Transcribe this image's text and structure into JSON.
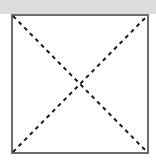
{
  "figure": {
    "caption": "",
    "canvas": {
      "width": 156,
      "height": 162,
      "background_color": "#ffffff"
    },
    "top_band": {
      "name": "grey header band",
      "color": "#dcdcdc",
      "x": 0,
      "y": 0,
      "width": 156,
      "height": 14
    },
    "square": {
      "label": "square outline",
      "x": 12,
      "y": 15,
      "width": 136,
      "height": 138,
      "stroke_color": "#6b6b6b",
      "stroke_width": 2,
      "fill_color": "#ffffff",
      "corners": {
        "top_left": [
          12,
          15
        ],
        "top_right": [
          148,
          15
        ],
        "bottom_right": [
          148,
          153
        ],
        "bottom_left": [
          12,
          153
        ]
      }
    },
    "diagonals": [
      {
        "label": "diagonal top-left to bottom-right",
        "from": [
          13,
          16
        ],
        "to": [
          147,
          152
        ],
        "stroke_color": "#1a1a1a",
        "stroke_width": 2,
        "dash_pattern": "4 4"
      },
      {
        "label": "diagonal bottom-left to top-right",
        "from": [
          13,
          152
        ],
        "to": [
          147,
          16
        ],
        "stroke_color": "#1a1a1a",
        "stroke_width": 2,
        "dash_pattern": "4 4"
      }
    ],
    "intersection": {
      "label": "diagonal crossing point",
      "x": 80,
      "y": 84
    }
  }
}
